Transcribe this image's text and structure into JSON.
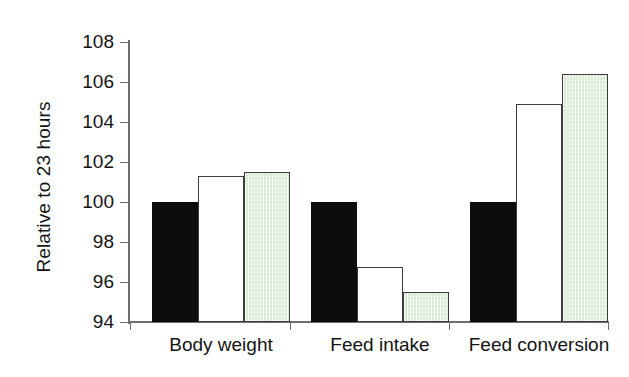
{
  "chart_data": {
    "type": "bar",
    "title": "",
    "subtitle": "",
    "xlabel": "",
    "ylabel": "Relative to 23 hours",
    "ylim": [
      94,
      108
    ],
    "yticks": [
      94,
      96,
      98,
      100,
      102,
      104,
      106,
      108
    ],
    "ytick_labels": [
      "94",
      "96",
      "98",
      "100",
      "102",
      "104",
      "106",
      "108"
    ],
    "grid": false,
    "legend": "none",
    "categories": [
      "Body weight",
      "Feed intake",
      "Feed conversion"
    ],
    "series": [
      {
        "name": "23 hours (reference)",
        "style": "solid-black",
        "color": "#0d0d0d",
        "values": [
          100.0,
          100.0,
          100.0
        ]
      },
      {
        "name": "white",
        "style": "open-outline",
        "color": "#ffffff",
        "edge_color": "#3d3d3d",
        "values": [
          101.3,
          96.75,
          104.9
        ]
      },
      {
        "name": "green",
        "style": "hatched-green",
        "color": "#d8ecd5",
        "edge_color": "#3d3d3d",
        "values": [
          101.5,
          95.5,
          106.4
        ]
      }
    ]
  },
  "axis": {
    "y_title": "Relative to 23 hours"
  }
}
